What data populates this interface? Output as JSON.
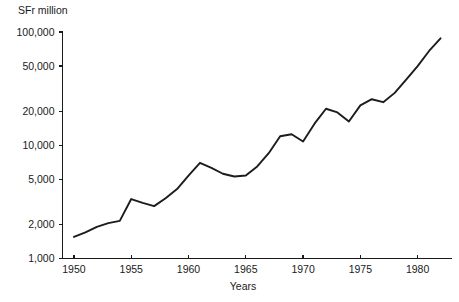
{
  "chart_data": {
    "type": "line",
    "title": "",
    "ylabel": "SFr million",
    "xlabel": "Years",
    "yscale": "log",
    "ylim": [
      1000,
      100000
    ],
    "xlim": [
      1949,
      1983
    ],
    "grid": false,
    "legend": null,
    "y_tick_labels": [
      "100,000",
      "50,000",
      "20,000",
      "10,000",
      "5,000",
      "2,000",
      "1,000"
    ],
    "y_tick_values": [
      100000,
      50000,
      20000,
      10000,
      5000,
      2000,
      1000
    ],
    "x_tick_labels": [
      "1950",
      "1955",
      "1960",
      "1965",
      "1970",
      "1975",
      "1980"
    ],
    "x_tick_values": [
      1950,
      1955,
      1960,
      1965,
      1970,
      1975,
      1980
    ],
    "series": [
      {
        "name": "SFr million",
        "x": [
          1950,
          1951,
          1952,
          1953,
          1954,
          1955,
          1956,
          1957,
          1958,
          1959,
          1960,
          1961,
          1962,
          1963,
          1964,
          1965,
          1966,
          1967,
          1968,
          1969,
          1970,
          1971,
          1972,
          1973,
          1974,
          1975,
          1976,
          1977,
          1978,
          1979,
          1980,
          1981,
          1982
        ],
        "values": [
          1550,
          1700,
          1900,
          2050,
          2150,
          3350,
          3100,
          2900,
          3400,
          4100,
          5400,
          7000,
          6300,
          5600,
          5300,
          5400,
          6500,
          8500,
          12000,
          12500,
          10800,
          15500,
          21000,
          19500,
          16200,
          22500,
          25500,
          24000,
          29000,
          38000,
          50000,
          68000,
          88000
        ]
      }
    ]
  },
  "axis_titles": {
    "y_unit": "SFr million",
    "x": "Years"
  }
}
